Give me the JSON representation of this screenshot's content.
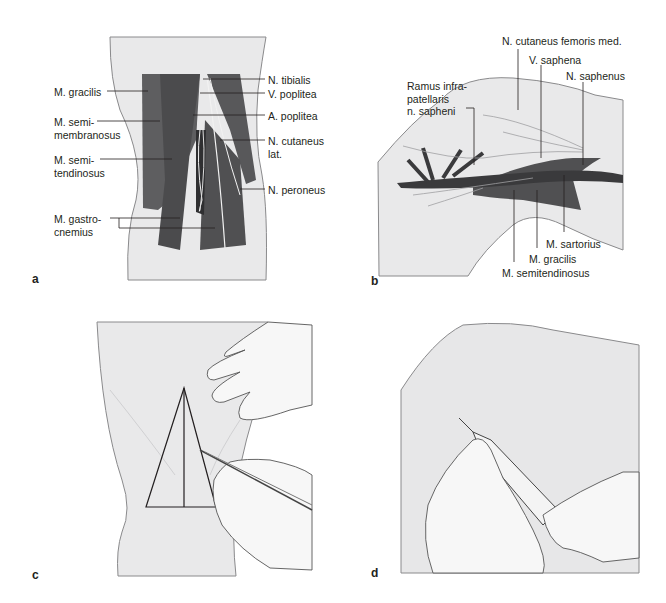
{
  "panels": {
    "a": {
      "letter": "a",
      "labels": {
        "gracilis": "M. gracilis",
        "semimembranosus": "M. semi-\nmembranosus",
        "semitendinosus": "M. semi-\ntendinosus",
        "gastrocnemius": "M. gastro-\ncnemius",
        "tibialis": "N. tibialis",
        "v_poplitea": "V. poplitea",
        "a_poplitea": "A. poplitea",
        "cutaneus_lat": "N. cutaneus\nlat.",
        "peroneus": "N. peroneus"
      }
    },
    "b": {
      "letter": "b",
      "labels": {
        "ramus": "Ramus infra-\npatellaris\nn. sapheni",
        "cutaneus_fem": "N. cutaneus femoris med.",
        "v_saphena": "V. saphena",
        "n_saphenus": "N. saphenus",
        "sartorius": "M. sartorius",
        "gracilis": "M. gracilis",
        "semitendinosus": "M. semitendinosus"
      }
    },
    "c": {
      "letter": "c"
    },
    "d": {
      "letter": "d"
    }
  },
  "colors": {
    "skin": "#e9e9ea",
    "skin_edge": "#8a8a8c",
    "muscle": "#5a5a5c",
    "muscle_dark": "#3a3a3c",
    "leader": "#231f20"
  }
}
